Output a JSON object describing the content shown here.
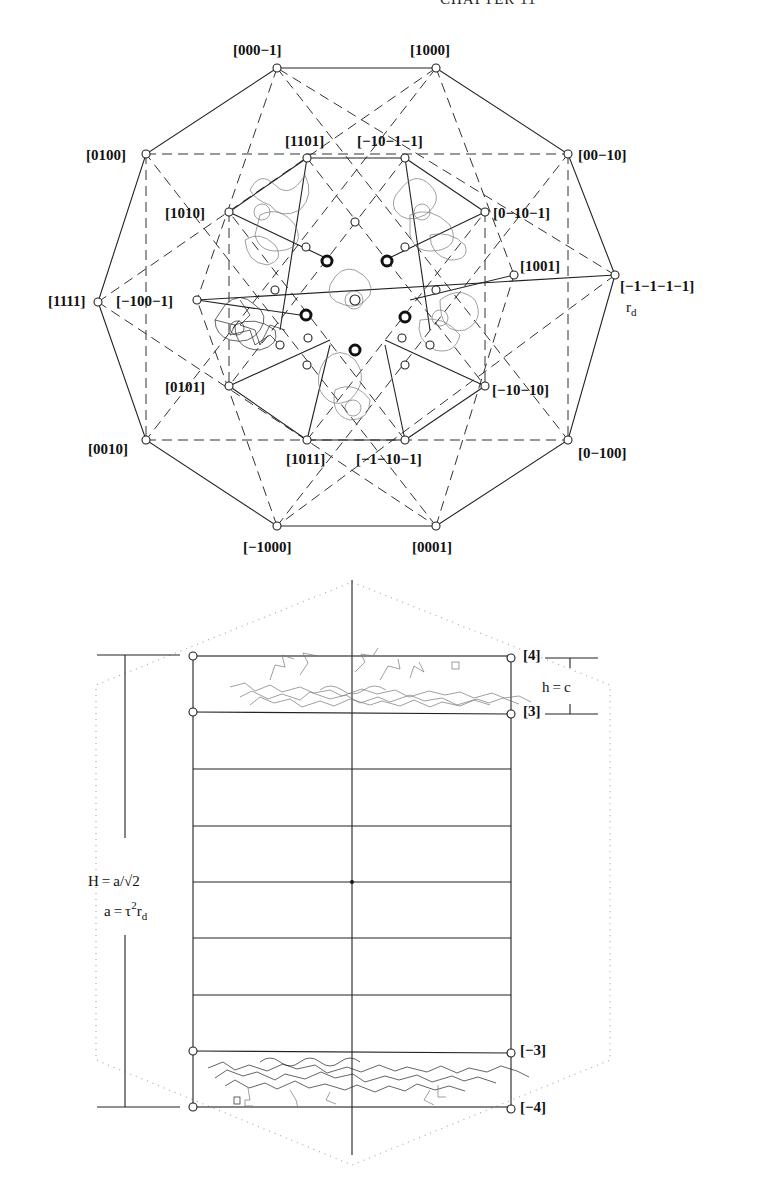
{
  "page": {
    "running_head": "CHAPTER 11"
  },
  "figure_top": {
    "title": "Projection of 4D decagonal lattice (zone axes)",
    "outer_vertices": [
      {
        "id": "v_000m1",
        "label": "[000−1]"
      },
      {
        "id": "v_1000",
        "label": "[1000]"
      },
      {
        "id": "v_00m10",
        "label": "[00−10]"
      },
      {
        "id": "v_m1m1m1m1",
        "label": "[−1−1−1−1]"
      },
      {
        "id": "v_0m100",
        "label": "[0−100]"
      },
      {
        "id": "v_0001",
        "label": "[0001]"
      },
      {
        "id": "v_m1000",
        "label": "[−1000]"
      },
      {
        "id": "v_0010",
        "label": "[0010]"
      },
      {
        "id": "v_1111",
        "label": "[1111]"
      },
      {
        "id": "v_0100",
        "label": "[0100]"
      }
    ],
    "inner_vertices": [
      {
        "id": "i_1101",
        "label": "[1101]"
      },
      {
        "id": "i_m10m1m1",
        "label": "[−10−1−1]"
      },
      {
        "id": "i_0m10m1",
        "label": "[0−10−1]"
      },
      {
        "id": "i_1001",
        "label": "[1001]"
      },
      {
        "id": "i_m10m10",
        "label": "[−10−10]"
      },
      {
        "id": "i_m1m10m1",
        "label": "[−1−10−1]"
      },
      {
        "id": "i_1011",
        "label": "[1011]"
      },
      {
        "id": "i_0101",
        "label": "[0101]"
      },
      {
        "id": "i_m100m1",
        "label": "[−100−1]"
      },
      {
        "id": "i_1010",
        "label": "[1010]"
      }
    ],
    "radius_label": "r",
    "radius_subscript": "d"
  },
  "figure_bottom": {
    "layer_labels": {
      "top": "[4]",
      "top_inner": "[3]",
      "bottom_inner": "[−3]",
      "bottom": "[−4]"
    },
    "h_label": "h = c",
    "H_label": "H = a/√2",
    "a_label_prefix": "a = τ",
    "a_label_sup": "2",
    "a_label_r": "r",
    "a_label_sub": "d",
    "layer_count": 8
  }
}
